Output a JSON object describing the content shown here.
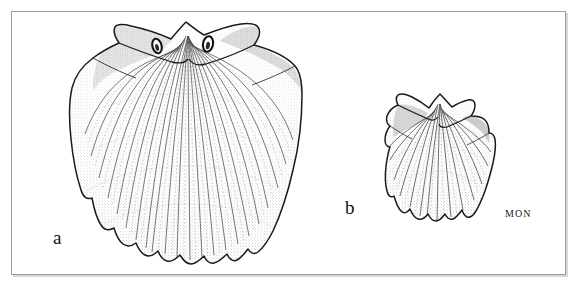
{
  "figure": {
    "kind": "scientific-illustration-plate",
    "background_color": "#ffffff",
    "frame": {
      "border_color": "#9a9a9a",
      "shadow_color": "#d8d8d8",
      "x": 11,
      "y": 11,
      "width": 555,
      "height": 264
    },
    "ink_color": "#1a1a1a",
    "stipple_color": "#7d7d7d",
    "shade_color": "#cfcfcf"
  },
  "labels": {
    "specimen_a": "a",
    "specimen_b": "b",
    "credit": "MON"
  },
  "specimens": [
    {
      "id": "specimen-a",
      "label": "a",
      "subject": "scallop-shell-valve",
      "position": "left",
      "relative_size": "large",
      "rib_count": 19,
      "features": [
        "umbo",
        "two-auricles",
        "two-eye-spots",
        "radial-ribs",
        "crenulate-margin"
      ],
      "bounds": {
        "x": 70,
        "y": 22,
        "width": 232,
        "height": 242
      }
    },
    {
      "id": "specimen-b",
      "label": "b",
      "subject": "scallop-shell-valve",
      "position": "right",
      "relative_size": "small",
      "rib_count": 13,
      "features": [
        "umbo",
        "two-auricles",
        "radial-ribs",
        "crenulate-margin"
      ],
      "bounds": {
        "x": 385,
        "y": 94,
        "width": 110,
        "height": 127
      }
    }
  ]
}
